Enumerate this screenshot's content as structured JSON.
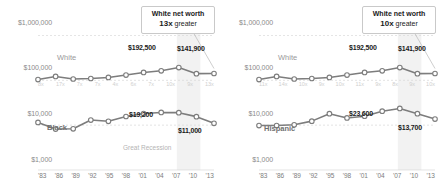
{
  "figure": {
    "axis": {
      "y_ticks": [
        "$1,000,000",
        "$100,000",
        "$10,000",
        "$1,000"
      ],
      "x_ticks": [
        "'83",
        "'86",
        "'89",
        "'92",
        "'95",
        "'98",
        "'01",
        "'04",
        "'07",
        "'10",
        "'13"
      ]
    },
    "colors": {
      "line": "#7d7d7d",
      "marker_fill": "#ffffff",
      "grid": "#d8d8d8",
      "band": "#ededed",
      "text": "#1a1a1a",
      "muted": "#9a9a9a",
      "faint": "#cfcfcf"
    },
    "annotations": {
      "recession_label": "Great Recession"
    }
  },
  "chart_data": [
    {
      "type": "line",
      "title": "",
      "panel": "left",
      "xlabel": "",
      "ylabel": "",
      "x": [
        "'83",
        "'86",
        "'89",
        "'92",
        "'95",
        "'98",
        "'01",
        "'04",
        "'07",
        "'10",
        "'13"
      ],
      "yscale": "log",
      "ylim": [
        1000,
        2000000
      ],
      "grid": true,
      "legend": "inline",
      "callout": {
        "line1": "White net worth",
        "line2_value": "13x",
        "line2_rest": "greater"
      },
      "ratio_labels": [
        "8x",
        "17x",
        "7x",
        "7x",
        "4x",
        "6x",
        "7x",
        "10x",
        "9x",
        "13x"
      ],
      "series": [
        {
          "name": "White",
          "label": "White",
          "values": [
            104000,
            122000,
            107000,
            110000,
            116000,
            131000,
            150000,
            163000,
            192500,
            141000,
            141900
          ],
          "point_labels": [
            {
              "index": 8,
              "text": "$192,500"
            },
            {
              "index": 10,
              "text": "$141,900"
            }
          ]
        },
        {
          "name": "Black",
          "label": "Black",
          "values": [
            11500,
            8200,
            8300,
            13000,
            12200,
            15600,
            18200,
            19200,
            19000,
            15500,
            11000
          ],
          "point_labels": [
            {
              "index": 7,
              "text": "$19,200"
            },
            {
              "index": 10,
              "text": "$11,000"
            }
          ]
        }
      ]
    },
    {
      "type": "line",
      "title": "",
      "panel": "right",
      "xlabel": "",
      "ylabel": "",
      "x": [
        "'83",
        "'86",
        "'89",
        "'92",
        "'95",
        "'98",
        "'01",
        "'04",
        "'07",
        "'10",
        "'13"
      ],
      "yscale": "log",
      "ylim": [
        1000,
        2000000
      ],
      "grid": true,
      "legend": "inline",
      "callout": {
        "line1": "White net worth",
        "line2_value": "10x",
        "line2_rest": "greater"
      },
      "ratio_labels": [
        "11x",
        "14x",
        "10x",
        "9x",
        "10x",
        "11x",
        "9x",
        "8x",
        "9x",
        "10x"
      ],
      "series": [
        {
          "name": "White",
          "label": "White",
          "values": [
            104000,
            122000,
            107000,
            110000,
            116000,
            131000,
            150000,
            163000,
            192500,
            141000,
            141900
          ],
          "point_labels": [
            {
              "index": 8,
              "text": "$192,500"
            },
            {
              "index": 10,
              "text": "$141,900"
            }
          ]
        },
        {
          "name": "Hispanic",
          "label": "Hispanic",
          "values": [
            9800,
            9800,
            10200,
            12300,
            18000,
            14500,
            15800,
            20500,
            23600,
            18000,
            13700
          ],
          "point_labels": [
            {
              "index": 8,
              "text": "$23,600"
            },
            {
              "index": 10,
              "text": "$13,700"
            }
          ]
        }
      ]
    }
  ]
}
